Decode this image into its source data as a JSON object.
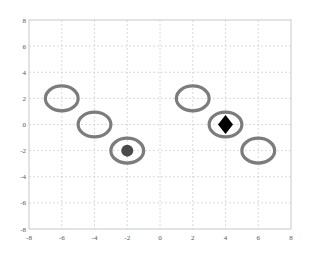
{
  "chart_data": {
    "type": "scatter",
    "title": "",
    "xlabel": "",
    "ylabel": "",
    "xlim": [
      -8,
      8
    ],
    "ylim": [
      -8,
      8
    ],
    "grid": true,
    "legend": null,
    "x_ticks": [
      -8,
      -6,
      -4,
      -2,
      0,
      2,
      4,
      6,
      8
    ],
    "y_ticks": [
      8,
      6,
      4,
      2,
      0,
      -2,
      -4,
      -6,
      -8
    ],
    "series": [
      {
        "name": "ellipses",
        "marker": "ellipse-outline",
        "color": "#6e6e6e",
        "points": [
          {
            "x": -6,
            "y": 2
          },
          {
            "x": -4,
            "y": 0
          },
          {
            "x": -2,
            "y": -2
          },
          {
            "x": 2,
            "y": 2
          },
          {
            "x": 4,
            "y": 0
          },
          {
            "x": 6,
            "y": -2
          }
        ],
        "rx": 1.0,
        "ry": 0.95
      },
      {
        "name": "circle-point",
        "marker": "filled-circle",
        "color": "#4a4a4a",
        "points": [
          {
            "x": -2,
            "y": -2
          }
        ]
      },
      {
        "name": "diamond-point",
        "marker": "filled-diamond",
        "color": "#000000",
        "points": [
          {
            "x": 4,
            "y": 0
          }
        ]
      }
    ]
  },
  "colors": {
    "grid": "#d0d0d0",
    "axis": "#c8c8c8",
    "tick_text": "#555555"
  }
}
